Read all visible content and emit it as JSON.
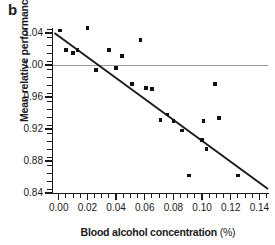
{
  "panel": {
    "label": "b"
  },
  "axis_titles": {
    "y": "Mean relative performance",
    "x_main": "Blood alcohol concentration ",
    "x_unit": "(%)"
  },
  "ticks": {
    "y_labels": [
      "1.04",
      "1.00",
      "0.96",
      "0.92",
      "0.88",
      "0.84"
    ],
    "x_labels": [
      "0.00",
      "0.02",
      "0.04",
      "0.06",
      "0.08",
      "0.10",
      "0.12",
      "0.14"
    ]
  },
  "colors": {
    "marker": "#111111",
    "fit_line": "#1a1a1a",
    "reference_line": "#9a9a9a",
    "axis": "#1a1a1a",
    "background": "#ffffff"
  },
  "chart_data": {
    "type": "scatter",
    "title": "",
    "subtitle": "",
    "xlabel": "Blood alcohol concentration (%)",
    "ylabel": "Mean relative performance",
    "xlim": [
      -0.004,
      0.146
    ],
    "ylim": [
      0.84,
      1.055
    ],
    "xticks": [
      0.0,
      0.02,
      0.04,
      0.06,
      0.08,
      0.1,
      0.12,
      0.14
    ],
    "yticks": [
      0.84,
      0.88,
      0.92,
      0.96,
      1.0,
      1.04
    ],
    "grid": false,
    "legend": "none",
    "minor_ticks": {
      "x_step": 0.005,
      "y_step": 0.01
    },
    "series": [
      {
        "name": "Mean relative performance vs blood alcohol concentration",
        "marker": "square",
        "points": [
          {
            "x": 0.001,
            "y": 1.043
          },
          {
            "x": 0.005,
            "y": 1.019
          },
          {
            "x": 0.01,
            "y": 1.015
          },
          {
            "x": 0.013,
            "y": 1.019
          },
          {
            "x": 0.02,
            "y": 1.046
          },
          {
            "x": 0.026,
            "y": 0.994
          },
          {
            "x": 0.035,
            "y": 1.019
          },
          {
            "x": 0.04,
            "y": 0.996
          },
          {
            "x": 0.044,
            "y": 1.011
          },
          {
            "x": 0.057,
            "y": 1.031
          },
          {
            "x": 0.051,
            "y": 0.976
          },
          {
            "x": 0.061,
            "y": 0.971
          },
          {
            "x": 0.065,
            "y": 0.97
          },
          {
            "x": 0.071,
            "y": 0.931
          },
          {
            "x": 0.076,
            "y": 0.938
          },
          {
            "x": 0.08,
            "y": 0.93
          },
          {
            "x": 0.086,
            "y": 0.918
          },
          {
            "x": 0.091,
            "y": 0.862
          },
          {
            "x": 0.1,
            "y": 0.906
          },
          {
            "x": 0.103,
            "y": 0.895
          },
          {
            "x": 0.101,
            "y": 0.93
          },
          {
            "x": 0.109,
            "y": 0.976
          },
          {
            "x": 0.112,
            "y": 0.934
          },
          {
            "x": 0.125,
            "y": 0.862
          }
        ]
      }
    ],
    "fit_line": {
      "type": "linear-regression",
      "x_start": -0.003,
      "y_start": 1.04,
      "x_end": 0.146,
      "y_end": 0.845
    },
    "reference_line": {
      "orientation": "horizontal",
      "y": 1.0,
      "color": "#9a9a9a"
    }
  }
}
